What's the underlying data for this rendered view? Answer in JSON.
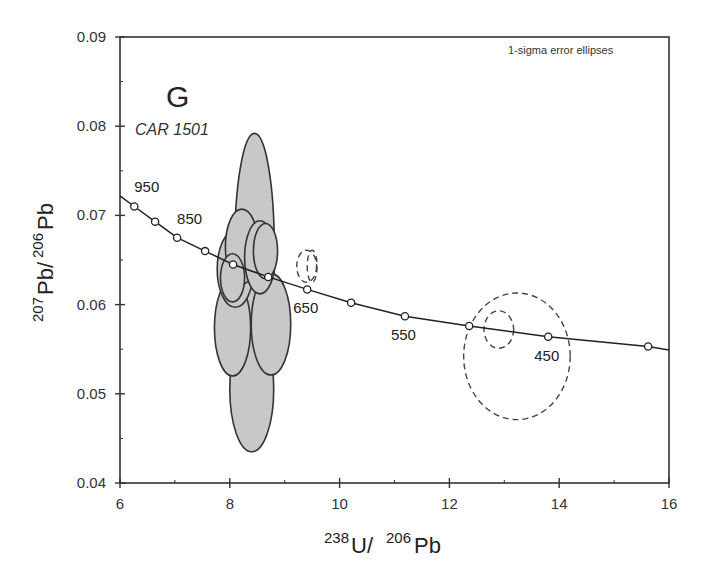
{
  "chart_data": {
    "type": "scatter",
    "subtype": "Tera-Wasserburg concordia diagram with error ellipses",
    "panel_letter": "G",
    "sample": "CAR 1501",
    "annotation": "1-sigma error ellipses",
    "xlabel": {
      "sup1": "238",
      "main1": "U/",
      "sup2": "206",
      "main2": "Pb"
    },
    "ylabel": {
      "sup1": "207",
      "main1": "Pb/",
      "sup2": "206",
      "main2": "Pb"
    },
    "xlim": [
      6,
      16
    ],
    "ylim": [
      0.04,
      0.09
    ],
    "x_ticks": [
      6,
      8,
      10,
      12,
      14,
      16
    ],
    "x_tick_labels": [
      "6",
      "8",
      "10",
      "12",
      "14",
      "16"
    ],
    "x_minor_ticks": [
      7,
      9,
      11,
      13,
      15
    ],
    "y_ticks": [
      0.04,
      0.05,
      0.06,
      0.07,
      0.08,
      0.09
    ],
    "y_tick_labels": [
      "0.04",
      "0.05",
      "0.06",
      "0.07",
      "0.08",
      "0.09"
    ],
    "y_minor_ticks": [
      0.045,
      0.055,
      0.065,
      0.075,
      0.085
    ],
    "grid": false,
    "concordia": {
      "curve_start": {
        "x": 6.0,
        "y": 0.0722
      },
      "curve_end": {
        "x": 16.0,
        "y": 0.0549
      },
      "points": [
        {
          "age": 950,
          "x": 6.26,
          "y": 0.071,
          "label": "950"
        },
        {
          "age": 900,
          "x": 6.64,
          "y": 0.0693,
          "label": ""
        },
        {
          "age": 850,
          "x": 7.04,
          "y": 0.0675,
          "label": "850"
        },
        {
          "age": 800,
          "x": 7.55,
          "y": 0.066,
          "label": ""
        },
        {
          "age": 750,
          "x": 8.06,
          "y": 0.0645,
          "label": ""
        },
        {
          "age": 700,
          "x": 8.7,
          "y": 0.0631,
          "label": ""
        },
        {
          "age": 650,
          "x": 9.41,
          "y": 0.0617,
          "label": "650"
        },
        {
          "age": 600,
          "x": 10.21,
          "y": 0.0602,
          "label": ""
        },
        {
          "age": 550,
          "x": 11.19,
          "y": 0.0587,
          "label": "550"
        },
        {
          "age": 500,
          "x": 12.36,
          "y": 0.0576,
          "label": ""
        },
        {
          "age": 450,
          "x": 13.8,
          "y": 0.0564,
          "label": "450"
        },
        {
          "age": 400,
          "x": 15.62,
          "y": 0.0553,
          "label": ""
        }
      ]
    },
    "ellipses": [
      {
        "id": "e1",
        "style": "filled",
        "cx": 8.45,
        "cy": 0.0665,
        "rx": 0.36,
        "ry": 0.0127
      },
      {
        "id": "e2",
        "style": "filled",
        "cx": 8.4,
        "cy": 0.0505,
        "rx": 0.4,
        "ry": 0.007
      },
      {
        "id": "e3",
        "style": "filled",
        "cx": 8.05,
        "cy": 0.0574,
        "rx": 0.33,
        "ry": 0.0054
      },
      {
        "id": "e4",
        "style": "filled",
        "cx": 8.75,
        "cy": 0.0578,
        "rx": 0.36,
        "ry": 0.0057
      },
      {
        "id": "e5",
        "style": "filled",
        "cx": 8.1,
        "cy": 0.064,
        "rx": 0.33,
        "ry": 0.0043
      },
      {
        "id": "e6",
        "style": "filled",
        "cx": 8.22,
        "cy": 0.0665,
        "rx": 0.3,
        "ry": 0.0042
      },
      {
        "id": "e7",
        "style": "filled",
        "cx": 8.55,
        "cy": 0.0653,
        "rx": 0.28,
        "ry": 0.0041
      },
      {
        "id": "e8",
        "style": "filled",
        "cx": 8.65,
        "cy": 0.066,
        "rx": 0.22,
        "ry": 0.0031
      },
      {
        "id": "e9",
        "style": "filled",
        "cx": 8.05,
        "cy": 0.063,
        "rx": 0.22,
        "ry": 0.0027
      },
      {
        "id": "d1",
        "style": "dashed",
        "cx": 9.4,
        "cy": 0.0643,
        "rx": 0.18,
        "ry": 0.0018
      },
      {
        "id": "d2",
        "style": "dashed",
        "cx": 9.5,
        "cy": 0.0643,
        "rx": 0.09,
        "ry": 0.0018
      },
      {
        "id": "d3",
        "style": "dashed",
        "cx": 12.9,
        "cy": 0.0572,
        "rx": 0.27,
        "ry": 0.0021
      },
      {
        "id": "d4",
        "style": "dashed",
        "cx": 13.23,
        "cy": 0.0542,
        "rx": 0.97,
        "ry": 0.0071
      }
    ],
    "colors": {
      "ellipse_fill": "#c8c8c8",
      "ellipse_stroke": "#333333",
      "axis": "#333333",
      "curve": "#222222",
      "marker_fill": "#ffffff",
      "background": "#ffffff"
    }
  },
  "layout": {
    "plot_px": {
      "left": 120,
      "right": 669,
      "top": 37,
      "bottom": 483
    }
  }
}
